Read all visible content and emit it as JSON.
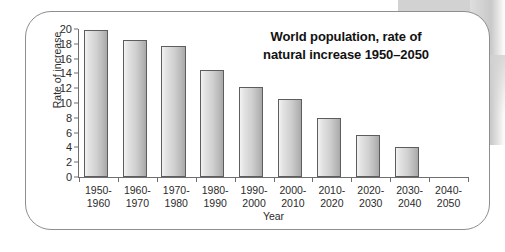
{
  "chart_data": {
    "type": "bar",
    "title": "World population, rate of natural increase 1950–2050",
    "title_line1": "World population, rate of",
    "title_line2": "natural increase 1950–2050",
    "xlabel": "Year",
    "ylabel": "Rate of increase",
    "ylim": [
      0,
      20
    ],
    "ytick_step": 2,
    "yticks": [
      0,
      2,
      4,
      6,
      8,
      10,
      12,
      14,
      16,
      18,
      20
    ],
    "grid": false,
    "legend": false,
    "categories": [
      "1950-1960",
      "1960-1970",
      "1970-1980",
      "1980-1990",
      "1990-2000",
      "2000-2010",
      "2010-2020",
      "2020-2030",
      "2030-2040",
      "2040-2050"
    ],
    "category_lines": [
      [
        "1950-",
        "1960"
      ],
      [
        "1960-",
        "1970"
      ],
      [
        "1970-",
        "1980"
      ],
      [
        "1980-",
        "1990"
      ],
      [
        "1990-",
        "2000"
      ],
      [
        "2000-",
        "2010"
      ],
      [
        "2010-",
        "2020"
      ],
      [
        "2020-",
        "2030"
      ],
      [
        "2030-",
        "2040"
      ],
      [
        "2040-",
        "2050"
      ]
    ],
    "values": [
      19.9,
      18.5,
      17.7,
      14.5,
      12.2,
      10.5,
      8.0,
      5.7,
      4.0,
      0
    ],
    "bar_color_light": "#f2f2f2",
    "bar_color_dark": "#a8a8a8",
    "bar_border_color": "#5d5d5d",
    "axis_color": "#6e6e6e",
    "text_color": "#2b2b2b",
    "frame_color": "#8e8e8e",
    "background": "#ffffff"
  }
}
